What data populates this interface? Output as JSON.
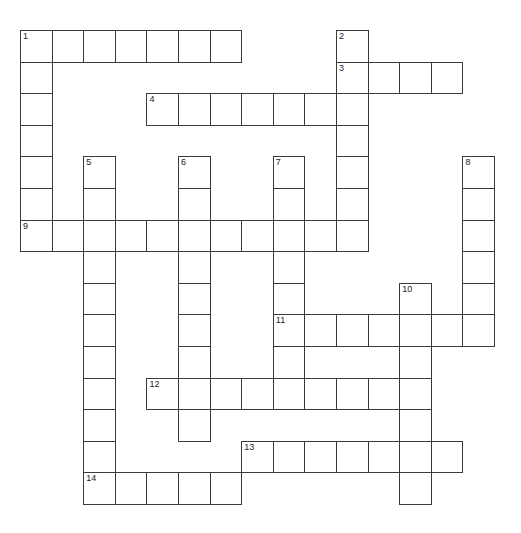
{
  "puzzle": {
    "type": "crossword",
    "grid_origin": {
      "x": 20,
      "y": 30
    },
    "cell_size": 31.6,
    "line_color": "#3a3a3a",
    "background": "#ffffff",
    "entries": [
      {
        "number": "1",
        "direction": "across",
        "row": 0,
        "col": 0,
        "length": 7
      },
      {
        "number": "1",
        "direction": "down",
        "row": 0,
        "col": 0,
        "length": 7
      },
      {
        "number": "2",
        "direction": "down",
        "row": 0,
        "col": 10,
        "length": 7
      },
      {
        "number": "3",
        "direction": "across",
        "row": 1,
        "col": 10,
        "length": 4
      },
      {
        "number": "4",
        "direction": "across",
        "row": 2,
        "col": 4,
        "length": 7
      },
      {
        "number": "5",
        "direction": "down",
        "row": 4,
        "col": 2,
        "length": 11
      },
      {
        "number": "6",
        "direction": "down",
        "row": 4,
        "col": 5,
        "length": 9
      },
      {
        "number": "7",
        "direction": "down",
        "row": 4,
        "col": 8,
        "length": 8
      },
      {
        "number": "8",
        "direction": "down",
        "row": 4,
        "col": 14,
        "length": 6
      },
      {
        "number": "9",
        "direction": "across",
        "row": 6,
        "col": 0,
        "length": 11
      },
      {
        "number": "10",
        "direction": "down",
        "row": 8,
        "col": 12,
        "length": 7
      },
      {
        "number": "11",
        "direction": "across",
        "row": 9,
        "col": 8,
        "length": 7
      },
      {
        "number": "12",
        "direction": "across",
        "row": 11,
        "col": 4,
        "length": 9
      },
      {
        "number": "13",
        "direction": "across",
        "row": 13,
        "col": 7,
        "length": 7
      },
      {
        "number": "14",
        "direction": "across",
        "row": 14,
        "col": 2,
        "length": 5
      }
    ]
  }
}
